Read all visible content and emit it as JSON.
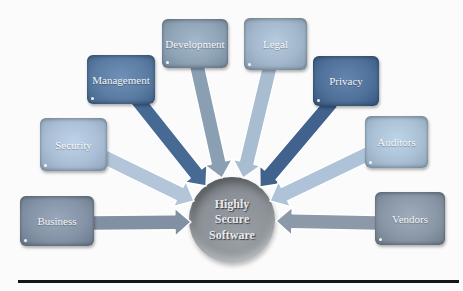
{
  "figure": {
    "center": {
      "label": "Highly\nSecure\nSoftware",
      "fill": "#8b9196",
      "text_color": "#e7eaee"
    },
    "nodes": [
      {
        "id": "business",
        "label": "Business",
        "fill": "#8494a6",
        "arrow": "#8191a3"
      },
      {
        "id": "security",
        "label": "Security",
        "fill": "#aabfd5",
        "arrow": "#b2c5d9"
      },
      {
        "id": "management",
        "label": "Management",
        "fill": "#5b7ca3",
        "arrow": "#476a94"
      },
      {
        "id": "development",
        "label": "Development",
        "fill": "#90a4b7",
        "arrow": "#8b9fb3"
      },
      {
        "id": "legal",
        "label": "Legal",
        "fill": "#a2b7cb",
        "arrow": "#a9bdd1"
      },
      {
        "id": "privacy",
        "label": "Privacy",
        "fill": "#50719a",
        "arrow": "#40628d"
      },
      {
        "id": "auditors",
        "label": "Auditors",
        "fill": "#aac0d5",
        "arrow": "#aec3d7"
      },
      {
        "id": "vendors",
        "label": "Vendors",
        "fill": "#8a97a7",
        "arrow": "#8b99a9"
      }
    ],
    "rule_color": "#161616"
  }
}
